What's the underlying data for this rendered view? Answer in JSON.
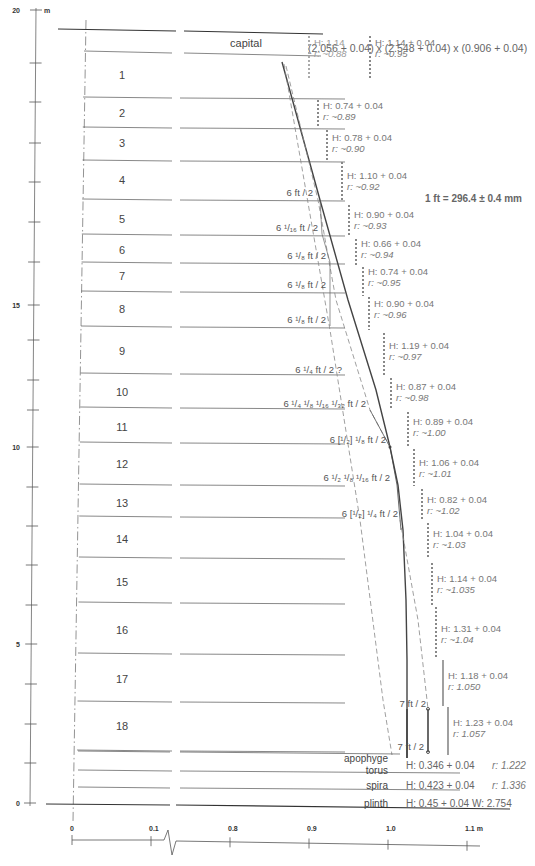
{
  "vertical_axis": {
    "unit": "m",
    "labels": [
      {
        "value": "20",
        "y": 10
      },
      {
        "value": "15",
        "y": 305
      },
      {
        "value": "10",
        "y": 447
      },
      {
        "value": "5",
        "y": 644
      },
      {
        "value": "0",
        "y": 803
      }
    ],
    "tick_ys": [
      10,
      63,
      102,
      143,
      182,
      222,
      262,
      305,
      340,
      380,
      410,
      447,
      487,
      526,
      565,
      605,
      644,
      684,
      724,
      763,
      803
    ]
  },
  "horizontal_axis": {
    "unit": "m",
    "ticks": [
      {
        "label": "0",
        "x": 72
      },
      {
        "label": "0.1",
        "x": 151
      },
      {
        "label": "0.8",
        "x": 230
      },
      {
        "label": "0.9",
        "x": 309
      },
      {
        "label": "1.0",
        "x": 388
      },
      {
        "label": "1.1 m",
        "x": 467
      }
    ]
  },
  "capital": {
    "label": "capital",
    "dimensions": "(2.056 + 0.04) x (2.548 + 0.04) x (0.906 + 0.04)"
  },
  "foot_definition": "1 ft = 296.4 ± 0.4 mm",
  "drums": [
    {
      "n": "1",
      "label_y": 75,
      "line_y": 97
    },
    {
      "n": "2",
      "label_y": 113,
      "line_y": 127
    },
    {
      "n": "3",
      "label_y": 143,
      "line_y": 160
    },
    {
      "n": "4",
      "label_y": 180,
      "line_y": 199
    },
    {
      "n": "5",
      "label_y": 219,
      "line_y": 234
    },
    {
      "n": "6",
      "label_y": 250,
      "line_y": 262
    },
    {
      "n": "7",
      "label_y": 276,
      "line_y": 291
    },
    {
      "n": "8",
      "label_y": 309,
      "line_y": 326
    },
    {
      "n": "9",
      "label_y": 351,
      "line_y": 373
    },
    {
      "n": "10",
      "label_y": 392,
      "line_y": 407
    },
    {
      "n": "11",
      "label_y": 427,
      "line_y": 442
    },
    {
      "n": "12",
      "label_y": 464,
      "line_y": 484
    },
    {
      "n": "13",
      "label_y": 503,
      "line_y": 516
    },
    {
      "n": "14",
      "label_y": 539,
      "line_y": 557
    },
    {
      "n": "15",
      "label_y": 582,
      "line_y": 602
    },
    {
      "n": "16",
      "label_y": 630,
      "line_y": 653
    },
    {
      "n": "17",
      "label_y": 679,
      "line_y": 701
    },
    {
      "n": "18",
      "label_y": 726,
      "line_y": 750
    }
  ],
  "drum_annotations": [
    {
      "h": "H: 1.14",
      "r": "r: ~0.88",
      "x": 314,
      "y": 46,
      "bar_top": 36,
      "bar_bot": 80,
      "style": "dotted-light"
    },
    {
      "h": "H: 1.14 + 0.04",
      "r": "r: ~0.95",
      "x": 375,
      "y": 46,
      "bar_top": 36,
      "bar_bot": 80,
      "style": "dotted"
    },
    {
      "h": "H: 0.74 + 0.04",
      "r": "r: ~0.89",
      "x": 323,
      "y": 109,
      "bar_top": 100,
      "bar_bot": 126,
      "style": "dotted"
    },
    {
      "h": "H: 0.78 + 0.04",
      "r": "r: ~0.90",
      "x": 332,
      "y": 141,
      "bar_top": 130,
      "bar_bot": 160,
      "style": "dotted"
    },
    {
      "h": "H: 1.10 + 0.04",
      "r": "r: ~0.92",
      "x": 347,
      "y": 179,
      "bar_top": 162,
      "bar_bot": 200,
      "style": "dotted"
    },
    {
      "h": "H: 0.90 + 0.04",
      "r": "r: ~0.93",
      "x": 354,
      "y": 218,
      "bar_top": 205,
      "bar_bot": 237,
      "style": "dotted"
    },
    {
      "h": "H: 0.66 + 0.04",
      "r": "r: ~0.94",
      "x": 361,
      "y": 247,
      "bar_top": 239,
      "bar_bot": 265,
      "style": "dotted"
    },
    {
      "h": "H: 0.74 + 0.04",
      "r": "r: ~0.95",
      "x": 368,
      "y": 275,
      "bar_top": 267,
      "bar_bot": 296,
      "style": "dotted"
    },
    {
      "h": "H: 0.90 + 0.04",
      "r": "r: ~0.96",
      "x": 374,
      "y": 307,
      "bar_top": 297,
      "bar_bot": 330,
      "style": "dotted"
    },
    {
      "h": "H: 1.19 + 0.04",
      "r": "r: ~0.97",
      "x": 389,
      "y": 349,
      "bar_top": 333,
      "bar_bot": 375,
      "style": "dotted"
    },
    {
      "h": "H: 0.87 + 0.04",
      "r": "r: ~0.98",
      "x": 396,
      "y": 390,
      "bar_top": 378,
      "bar_bot": 410,
      "style": "dotted"
    },
    {
      "h": "H: 0.89 + 0.04",
      "r": "r: ~1.00",
      "x": 413,
      "y": 425,
      "bar_top": 412,
      "bar_bot": 446,
      "style": "dotted"
    },
    {
      "h": "H: 1.06 + 0.04",
      "r": "r: ~1.01",
      "x": 419,
      "y": 466,
      "bar_top": 449,
      "bar_bot": 486,
      "style": "dotted"
    },
    {
      "h": "H: 0.82 + 0.04",
      "r": "r: ~1.02",
      "x": 427,
      "y": 503,
      "bar_top": 489,
      "bar_bot": 521,
      "style": "dotted"
    },
    {
      "h": "H: 1.04 + 0.04",
      "r": "r: ~1.03",
      "x": 433,
      "y": 537,
      "bar_top": 523,
      "bar_bot": 558,
      "style": "dotted"
    },
    {
      "h": "H: 1.14 + 0.04",
      "r": "r: ~1.035",
      "x": 437,
      "y": 582,
      "bar_top": 563,
      "bar_bot": 606,
      "style": "dotted"
    },
    {
      "h": "H: 1.31 + 0.04",
      "r": "r: ~1.04",
      "x": 441,
      "y": 632,
      "bar_top": 607,
      "bar_bot": 659,
      "style": "dotted"
    },
    {
      "h": "H: 1.18 + 0.04",
      "r": "r: 1.050",
      "x": 448,
      "y": 679,
      "bar_top": 660,
      "bar_bot": 706,
      "style": "solid"
    },
    {
      "h": "H: 1.23 + 0.04",
      "r": "r: 1.057",
      "x": 453,
      "y": 726,
      "bar_top": 707,
      "bar_bot": 755,
      "style": "solid"
    }
  ],
  "foot_marks": [
    {
      "text": "6 ft / 2",
      "x": 313,
      "y": 198
    },
    {
      "text": "6 ¹/₁₆ ft / 2",
      "x": 318,
      "y": 233
    },
    {
      "text": "6 ¹/₈ ft / 2",
      "x": 326,
      "y": 261
    },
    {
      "text": "6 ¹/₈ ft / 2",
      "x": 326,
      "y": 290
    },
    {
      "text": "6 ¹/₈ ft / 2",
      "x": 326,
      "y": 325
    },
    {
      "text": "6 ¹/₄ ft / 2 ?",
      "x": 342,
      "y": 375
    },
    {
      "text": "6 ¹/₄ ¹/₈ ¹/₁₆ ¹/₃₂ ft / 2",
      "x": 366,
      "y": 409
    },
    {
      "text": "6 [¹/₂] ¹/₈ ft / 2",
      "x": 386,
      "y": 445
    },
    {
      "text": "6 ¹/₂ ¹/₈ ¹/₁₆ ft / 2",
      "x": 390,
      "y": 483
    },
    {
      "text": "6 [¹/₂] ¹/₄ ft / 2",
      "x": 398,
      "y": 519
    },
    {
      "text": "7 ft / 2",
      "x": 426,
      "y": 709
    },
    {
      "text": "7 ft / 2",
      "x": 424,
      "y": 752
    }
  ],
  "base_parts": [
    {
      "label": "apophyge",
      "ann": "H: 0.346 + 0.04",
      "r": "r: 1.222",
      "label_y": 762,
      "ann_y": 769
    },
    {
      "label": "torus",
      "ann": "",
      "r": "",
      "label_y": 774,
      "ann_y": 774
    },
    {
      "label": "spira",
      "ann": "H: 0.423 + 0.04",
      "r": "r: 1.336",
      "label_y": 789,
      "ann_y": 789
    },
    {
      "label": "plinth",
      "ann": "H: 0.45 + 0.04 W: 2.754",
      "r": "",
      "label_y": 807,
      "ann_y": 807
    }
  ],
  "colors": {
    "line": "#444444",
    "thin_line": "#555555",
    "annotation": "#777777",
    "dashed": "#888888",
    "background": "#ffffff"
  }
}
